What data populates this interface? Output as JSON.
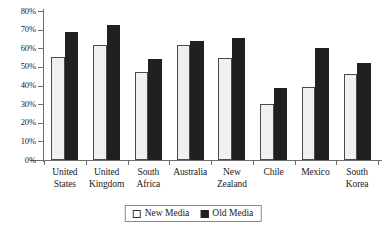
{
  "chart_data": {
    "type": "bar",
    "title": "",
    "subtitle": "",
    "xlabel": "",
    "ylabel": "",
    "ylim": [
      0,
      80
    ],
    "ytick_labels": [
      "0%",
      "10%",
      "20%",
      "30%",
      "40%",
      "50%",
      "60%",
      "70%",
      "80%"
    ],
    "ytick_values": [
      0,
      10,
      20,
      30,
      40,
      50,
      60,
      70,
      80
    ],
    "grid": false,
    "legend_position": "bottom-center",
    "categories": [
      "United States",
      "United Kingdom",
      "South Africa",
      "Australia",
      "New Zealand",
      "Chile",
      "Mexico",
      "South Korea"
    ],
    "category_lines": [
      [
        "United",
        "States"
      ],
      [
        "United",
        "Kingdom"
      ],
      [
        "South",
        "Africa"
      ],
      [
        "Australia"
      ],
      [
        "New",
        "Zealand"
      ],
      [
        "Chile"
      ],
      [
        "Mexico"
      ],
      [
        "South",
        "Korea"
      ]
    ],
    "series": [
      {
        "name": "New Media",
        "color": "#f0f0ee",
        "values": [
          55.5,
          61.5,
          47,
          62,
          55,
          30,
          39,
          46
        ]
      },
      {
        "name": "Old Media",
        "color": "#211f1f",
        "values": [
          69,
          72.5,
          54.5,
          64,
          65.5,
          38.5,
          60,
          52
        ]
      }
    ]
  },
  "legend": {
    "items": [
      {
        "label": "New Media",
        "swatch": "open-square-swatch"
      },
      {
        "label": "Old Media",
        "swatch": "filled-square-swatch"
      }
    ]
  }
}
